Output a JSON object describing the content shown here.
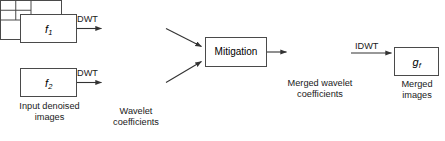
{
  "diagram": {
    "stroke_color": "#4a4a4a",
    "text_color": "#1a1a1a",
    "background": "#ffffff",
    "nodes": {
      "input1": {
        "symbol": "f",
        "subscript": "1"
      },
      "input2": {
        "symbol": "f",
        "subscript": "2"
      },
      "mitigation": {
        "label": "Mitigation"
      },
      "output": {
        "symbol": "g",
        "subscript": "f"
      }
    },
    "edge_labels": {
      "dwt1": "DWT",
      "dwt2": "DWT",
      "idwt": "IDWT"
    },
    "captions": {
      "input_images": "Input denoised\nimages",
      "wavelet_coefficients": "Wavelet\ncoefficients",
      "merged_wavelet_coefficients": "Merged wavelet\ncoefficients",
      "merged_images": "Merged\nimages"
    },
    "wavelet_panels": [
      {
        "name": "wavelet-coefficients-1"
      },
      {
        "name": "wavelet-coefficients-2"
      },
      {
        "name": "merged-wavelet-coefficients"
      }
    ]
  }
}
